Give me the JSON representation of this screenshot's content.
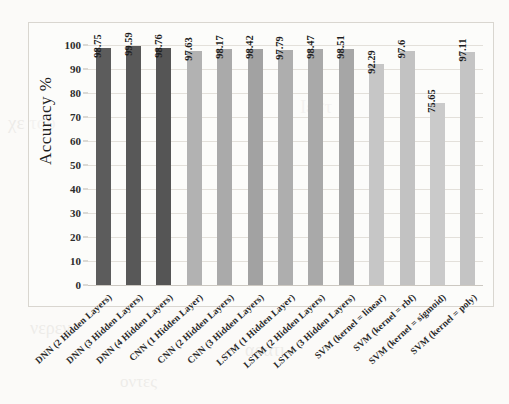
{
  "chart_data": {
    "type": "bar",
    "title": "",
    "xlabel": "",
    "ylabel": "Accuracy %",
    "ylim": [
      0,
      100
    ],
    "yticks": [
      0,
      10,
      20,
      30,
      40,
      50,
      60,
      70,
      80,
      90,
      100
    ],
    "grid": true,
    "legend": "none",
    "categories": [
      "DNN (2 Hidden Layers)",
      "DNN (3 Hidden Layers)",
      "DNN (4 Hidden Layers)",
      "CNN (1 Hidden Layer)",
      "CNN (2 Hidden Layers)",
      "CNN (3 Hidden Layers)",
      "LSTM (1 Hidden Layer)",
      "LSTM (2 Hidden Layers)",
      "LSTM (3 Hidden Layers)",
      "SVM (kernel = linear)",
      "SVM (kernel = rbf)",
      "SVM (kernel = sigmoid)",
      "SVM (kernel = poly)"
    ],
    "values": [
      98.75,
      99.59,
      98.76,
      97.63,
      98.17,
      98.42,
      97.79,
      98.47,
      98.51,
      92.29,
      97.6,
      75.65,
      97.11
    ],
    "value_labels": [
      "98.75",
      "99.59",
      "98.76",
      "97.63",
      "98.17",
      "98.42",
      "97.79",
      "98.47",
      "98.51",
      "92.29",
      "97.6",
      "75.65",
      "97.11"
    ],
    "bar_colors": [
      "#5c5c5c",
      "#585858",
      "#555555",
      "#b2b2b2",
      "#aaaaaa",
      "#a2a2a2",
      "#aeaeae",
      "#a9a9a9",
      "#a6a6a6",
      "#c6c6c6",
      "#c2c2c2",
      "#cacaca",
      "#c4c4c4"
    ]
  },
  "axes": {
    "y_title": "Accuracy %",
    "y_tick_labels": [
      "100",
      "90",
      "80",
      "70",
      "60",
      "50",
      "40",
      "30",
      "20",
      "10",
      "0"
    ]
  },
  "background_text": [
    "χε του",
    "Ιεστ",
    "νερεν",
    "αρατι",
    "οντες"
  ]
}
